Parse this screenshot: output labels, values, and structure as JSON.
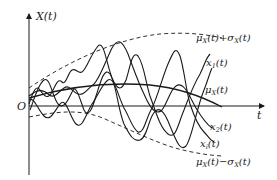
{
  "diagram": {
    "axes": {
      "y_label": "X(t)",
      "x_label": "t",
      "origin_label": "O"
    },
    "labels": {
      "upper_envelope": {
        "mu": "μ",
        "sub1": "X",
        "mid": "(t)+σ",
        "sub2": "X",
        "end": "(t)"
      },
      "x1": {
        "base": "x",
        "sub": "1",
        "end": "(t)"
      },
      "mean": {
        "base": "μ",
        "sub": "X",
        "end": "(t)"
      },
      "x2": {
        "base": "x",
        "sub": "2",
        "end": "(t)"
      },
      "xi": {
        "base": "x",
        "sub": "i",
        "end": "(t)"
      },
      "lower_envelope": {
        "mu": "μ",
        "sub1": "X",
        "mid": "(t)−σ",
        "sub2": "X",
        "end": "(t)"
      }
    },
    "colors": {
      "line": "#1a1a1a",
      "background": "#ffffff"
    }
  }
}
